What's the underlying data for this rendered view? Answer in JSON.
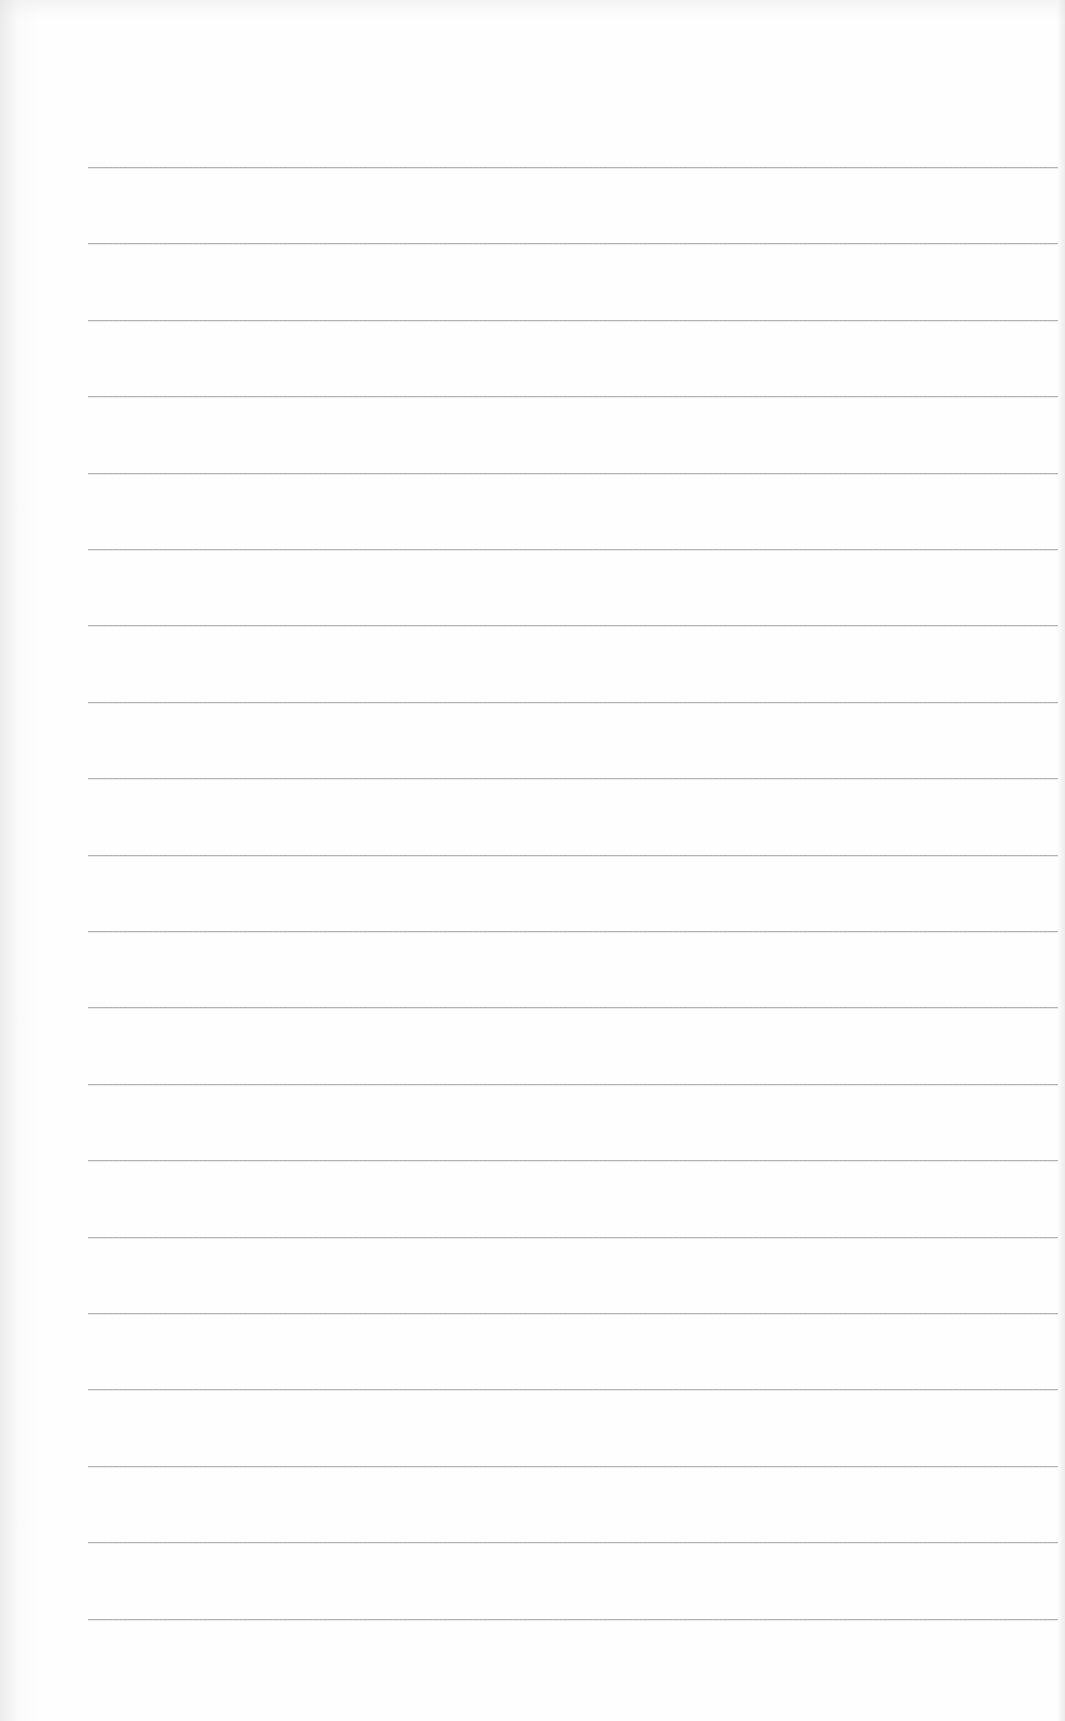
{
  "page": {
    "type": "blank ruled paper",
    "background_color": "#fefefe",
    "line_color": "#a0a0a0"
  },
  "rules": {
    "count": 20,
    "left_px": 88,
    "right_px": 1058,
    "first_y_px": 167,
    "spacing_px": 76.4
  }
}
